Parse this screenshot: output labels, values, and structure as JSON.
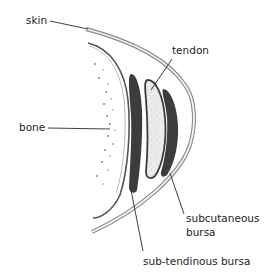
{
  "diagram": {
    "labels": {
      "skin": "skin",
      "bone": "bone",
      "tendon": "tendon",
      "subcutaneous_bursa_line1": "subcutaneous",
      "subcutaneous_bursa_line2": "bursa",
      "sub_tendinous_bursa": "sub-tendinous bursa"
    },
    "colors": {
      "bursa": "#3c3c3c",
      "tendon_fill": "#e6e6e6",
      "skin_stroke": "#8a8a8a",
      "bone_stroke": "#555555",
      "leader_line": "#2a2a2a"
    }
  }
}
